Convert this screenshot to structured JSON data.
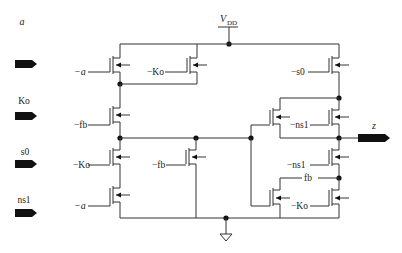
{
  "diagram": {
    "type": "transistor-level circuit schematic",
    "supply": {
      "label_main": "V",
      "label_sub": "DD"
    },
    "ground": {
      "label": "ground"
    },
    "inputs": [
      {
        "id": "a",
        "label": "a",
        "italic": true
      },
      {
        "id": "Ko",
        "label": "Ko",
        "italic": false
      },
      {
        "id": "s0",
        "label": "s0",
        "italic": false
      },
      {
        "id": "ns1",
        "label": "ns1",
        "italic": false
      }
    ],
    "outputs": [
      {
        "id": "z",
        "label": "z",
        "italic": true
      }
    ],
    "gate_labels": {
      "t1": "−a",
      "t2": "−Ko",
      "t3": "−fb",
      "t4": "−Ko",
      "t5": "−fb",
      "t6": "−a",
      "t7": "−s0",
      "t8": "−ns1",
      "t9": "−ns1",
      "t10": "fb",
      "t11": "−Ko"
    },
    "colors": {
      "wire": "#333333",
      "node": "#111111",
      "port": "#111111",
      "background": "#ffffff"
    }
  }
}
